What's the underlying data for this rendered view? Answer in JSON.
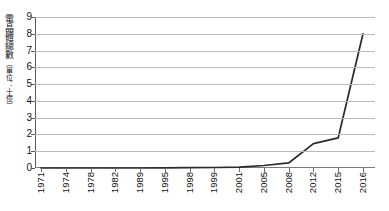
{
  "chart_data": {
    "type": "line",
    "title": "",
    "xlabel": "",
    "ylabel": "電晶體總數（單位：十億）",
    "ylabel_main": "電晶體總數",
    "ylabel_unit": "（單位：十億）",
    "ylim": [
      0,
      9
    ],
    "yticks": [
      0,
      1,
      2,
      3,
      4,
      5,
      6,
      7,
      8,
      9
    ],
    "grid": true,
    "legend": "none",
    "categories": [
      "1971",
      "1974",
      "1978",
      "1982",
      "1989",
      "1995",
      "1998",
      "1999",
      "2001",
      "2005",
      "2008",
      "2012",
      "2015",
      "2016"
    ],
    "x": [
      "1971",
      "1974",
      "1978",
      "1982",
      "1989",
      "1995",
      "1998",
      "1999",
      "2001",
      "2005",
      "2008",
      "2012",
      "2015",
      "2016"
    ],
    "values": [
      0.0,
      0.0,
      0.0,
      0.0,
      0.0,
      0.01,
      0.02,
      0.03,
      0.05,
      0.15,
      0.3,
      1.45,
      1.8,
      8.0
    ],
    "series": [
      {
        "name": "電晶體總數",
        "values": [
          0.0,
          0.0,
          0.0,
          0.0,
          0.0,
          0.01,
          0.02,
          0.03,
          0.05,
          0.15,
          0.3,
          1.45,
          1.8,
          8.0
        ]
      }
    ],
    "line_color": "#2b2b2b",
    "grid_color": "#b9b9b9",
    "background": "#ffffff"
  }
}
